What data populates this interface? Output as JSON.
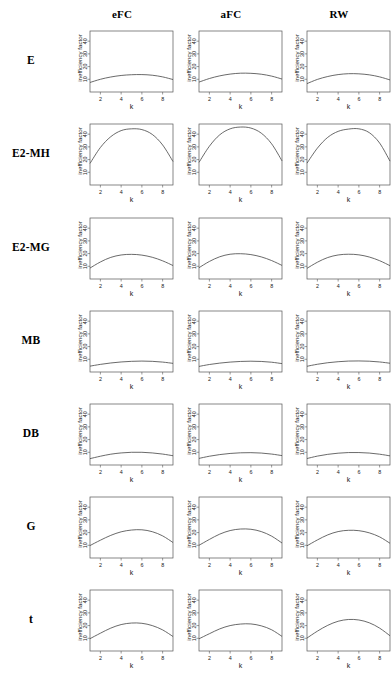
{
  "figure": {
    "row_labels": [
      "E",
      "E2-MH",
      "E2-MG",
      "MB",
      "DB",
      "G",
      "t"
    ],
    "col_labels": [
      "eFC",
      "aFC",
      "RW"
    ],
    "axis": {
      "ylabel": "inefficiency factor",
      "xlabel": "k",
      "ytick_labels": [
        "10",
        "20",
        "30",
        "40"
      ],
      "xtick_labels": [
        "2",
        "4",
        "6",
        "8"
      ]
    }
  },
  "chart_data": [
    {
      "type": "line",
      "title": "E / eFC",
      "row": "E",
      "column": "eFC",
      "xlabel": "k",
      "ylabel": "inefficiency factor",
      "xlim": [
        1,
        9
      ],
      "ylim": [
        0,
        48
      ],
      "xticks": [
        2,
        4,
        6,
        8
      ],
      "yticks": [
        10,
        20,
        30,
        40
      ],
      "grid": false,
      "legend": false,
      "x": [
        1,
        2,
        3,
        4,
        5,
        6,
        7,
        8,
        9
      ],
      "y": [
        7.5,
        10.0,
        11.8,
        13.0,
        13.6,
        13.7,
        13.2,
        11.9,
        9.8
      ]
    },
    {
      "type": "line",
      "title": "E / aFC",
      "row": "E",
      "column": "aFC",
      "xlabel": "k",
      "ylabel": "inefficiency factor",
      "xlim": [
        1,
        9
      ],
      "ylim": [
        0,
        48
      ],
      "xticks": [
        2,
        4,
        6,
        8
      ],
      "yticks": [
        10,
        20,
        30,
        40
      ],
      "grid": false,
      "legend": false,
      "x": [
        1,
        2,
        3,
        4,
        5,
        6,
        7,
        8,
        9
      ],
      "y": [
        7.8,
        10.6,
        12.7,
        14.1,
        14.8,
        14.7,
        14.0,
        12.5,
        10.2
      ]
    },
    {
      "type": "line",
      "title": "E / RW",
      "row": "E",
      "column": "RW",
      "xlabel": "k",
      "ylabel": "inefficiency factor",
      "xlim": [
        1,
        9
      ],
      "ylim": [
        0,
        48
      ],
      "xticks": [
        2,
        4,
        6,
        8
      ],
      "yticks": [
        10,
        20,
        30,
        40
      ],
      "grid": false,
      "legend": false,
      "x": [
        1,
        2,
        3,
        4,
        5,
        6,
        7,
        8,
        9
      ],
      "y": [
        6.6,
        9.9,
        12.2,
        13.7,
        14.4,
        14.3,
        13.5,
        11.9,
        9.5
      ]
    },
    {
      "type": "line",
      "title": "E2-MH / eFC",
      "row": "E2-MH",
      "column": "eFC",
      "xlabel": "k",
      "ylabel": "inefficiency factor",
      "xlim": [
        1,
        9
      ],
      "ylim": [
        0,
        48
      ],
      "xticks": [
        2,
        4,
        6,
        8
      ],
      "yticks": [
        10,
        20,
        30,
        40
      ],
      "grid": false,
      "legend": false,
      "x": [
        1,
        2,
        3,
        4,
        5,
        6,
        7,
        8,
        9
      ],
      "y": [
        17.0,
        29.5,
        38.0,
        42.8,
        44.2,
        43.6,
        39.8,
        31.5,
        18.5
      ]
    },
    {
      "type": "line",
      "title": "E2-MH / aFC",
      "row": "E2-MH",
      "column": "aFC",
      "xlabel": "k",
      "ylabel": "inefficiency factor",
      "xlim": [
        1,
        9
      ],
      "ylim": [
        0,
        48
      ],
      "xticks": [
        2,
        4,
        6,
        8
      ],
      "yticks": [
        10,
        20,
        30,
        40
      ],
      "grid": false,
      "legend": false,
      "x": [
        1,
        2,
        3,
        4,
        5,
        6,
        7,
        8,
        9
      ],
      "y": [
        17.8,
        30.5,
        39.5,
        44.2,
        45.6,
        44.8,
        40.8,
        32.4,
        19.0
      ]
    },
    {
      "type": "line",
      "title": "E2-MH / RW",
      "row": "E2-MH",
      "column": "RW",
      "xlabel": "k",
      "ylabel": "inefficiency factor",
      "xlim": [
        1,
        9
      ],
      "ylim": [
        0,
        48
      ],
      "xticks": [
        2,
        4,
        6,
        8
      ],
      "yticks": [
        10,
        20,
        30,
        40
      ],
      "grid": false,
      "legend": false,
      "x": [
        1,
        2,
        3,
        4,
        5,
        6,
        7,
        8,
        9
      ],
      "y": [
        17.2,
        29.0,
        37.5,
        42.2,
        44.0,
        44.2,
        41.2,
        33.0,
        18.8
      ]
    },
    {
      "type": "line",
      "title": "E2-MG / eFC",
      "row": "E2-MG",
      "column": "eFC",
      "xlabel": "k",
      "ylabel": "inefficiency factor",
      "xlim": [
        1,
        9
      ],
      "ylim": [
        0,
        48
      ],
      "xticks": [
        2,
        4,
        6,
        8
      ],
      "yticks": [
        10,
        20,
        30,
        40
      ],
      "grid": false,
      "legend": false,
      "x": [
        1,
        2,
        3,
        4,
        5,
        6,
        7,
        8,
        9
      ],
      "y": [
        8.6,
        13.4,
        17.0,
        18.9,
        19.4,
        18.8,
        17.1,
        14.3,
        10.6
      ]
    },
    {
      "type": "line",
      "title": "E2-MG / aFC",
      "row": "E2-MG",
      "column": "aFC",
      "xlabel": "k",
      "ylabel": "inefficiency factor",
      "xlim": [
        1,
        9
      ],
      "ylim": [
        0,
        48
      ],
      "xticks": [
        2,
        4,
        6,
        8
      ],
      "yticks": [
        10,
        20,
        30,
        40
      ],
      "grid": false,
      "legend": false,
      "x": [
        1,
        2,
        3,
        4,
        5,
        6,
        7,
        8,
        9
      ],
      "y": [
        8.9,
        13.8,
        17.5,
        19.5,
        19.9,
        19.2,
        17.4,
        14.5,
        10.7
      ]
    },
    {
      "type": "line",
      "title": "E2-MG / RW",
      "row": "E2-MG",
      "column": "RW",
      "xlabel": "k",
      "ylabel": "inefficiency factor",
      "xlim": [
        1,
        9
      ],
      "ylim": [
        0,
        48
      ],
      "xticks": [
        2,
        4,
        6,
        8
      ],
      "yticks": [
        10,
        20,
        30,
        40
      ],
      "grid": false,
      "legend": false,
      "x": [
        1,
        2,
        3,
        4,
        5,
        6,
        7,
        8,
        9
      ],
      "y": [
        8.4,
        13.2,
        16.9,
        18.9,
        19.5,
        19.0,
        17.3,
        14.4,
        10.5
      ]
    },
    {
      "type": "line",
      "title": "MB / eFC",
      "row": "MB",
      "column": "eFC",
      "xlabel": "k",
      "ylabel": "inefficiency factor",
      "xlim": [
        1,
        9
      ],
      "ylim": [
        0,
        48
      ],
      "xticks": [
        2,
        4,
        6,
        8
      ],
      "yticks": [
        10,
        20,
        30,
        40
      ],
      "grid": false,
      "legend": false,
      "x": [
        1,
        2,
        3,
        4,
        5,
        6,
        7,
        8,
        9
      ],
      "y": [
        4.6,
        6.0,
        7.1,
        7.9,
        8.4,
        8.6,
        8.4,
        7.8,
        6.8
      ]
    },
    {
      "type": "line",
      "title": "MB / aFC",
      "row": "MB",
      "column": "aFC",
      "xlabel": "k",
      "ylabel": "inefficiency factor",
      "xlim": [
        1,
        9
      ],
      "ylim": [
        0,
        48
      ],
      "xticks": [
        2,
        4,
        6,
        8
      ],
      "yticks": [
        10,
        20,
        30,
        40
      ],
      "grid": false,
      "legend": false,
      "x": [
        1,
        2,
        3,
        4,
        5,
        6,
        7,
        8,
        9
      ],
      "y": [
        4.4,
        5.9,
        7.0,
        7.8,
        8.3,
        8.5,
        8.3,
        7.7,
        6.6
      ]
    },
    {
      "type": "line",
      "title": "MB / RW",
      "row": "MB",
      "column": "RW",
      "xlabel": "k",
      "ylabel": "inefficiency factor",
      "xlim": [
        1,
        9
      ],
      "ylim": [
        0,
        48
      ],
      "xticks": [
        2,
        4,
        6,
        8
      ],
      "yticks": [
        10,
        20,
        30,
        40
      ],
      "grid": false,
      "legend": false,
      "x": [
        1,
        2,
        3,
        4,
        5,
        6,
        7,
        8,
        9
      ],
      "y": [
        4.5,
        6.1,
        7.3,
        8.1,
        8.6,
        8.7,
        8.5,
        7.9,
        6.9
      ]
    },
    {
      "type": "line",
      "title": "DB / eFC",
      "row": "DB",
      "column": "eFC",
      "xlabel": "k",
      "ylabel": "inefficiency factor",
      "xlim": [
        1,
        9
      ],
      "ylim": [
        0,
        48
      ],
      "xticks": [
        2,
        4,
        6,
        8
      ],
      "yticks": [
        10,
        20,
        30,
        40
      ],
      "grid": false,
      "legend": false,
      "x": [
        1,
        2,
        3,
        4,
        5,
        6,
        7,
        8,
        9
      ],
      "y": [
        5.0,
        6.9,
        8.5,
        9.5,
        10.0,
        10.0,
        9.5,
        8.6,
        7.3
      ]
    },
    {
      "type": "line",
      "title": "DB / aFC",
      "row": "DB",
      "column": "aFC",
      "xlabel": "k",
      "ylabel": "inefficiency factor",
      "xlim": [
        1,
        9
      ],
      "ylim": [
        0,
        48
      ],
      "xticks": [
        2,
        4,
        6,
        8
      ],
      "yticks": [
        10,
        20,
        30,
        40
      ],
      "grid": false,
      "legend": false,
      "x": [
        1,
        2,
        3,
        4,
        5,
        6,
        7,
        8,
        9
      ],
      "y": [
        5.2,
        6.9,
        8.2,
        9.1,
        9.6,
        9.7,
        9.4,
        8.6,
        7.4
      ]
    },
    {
      "type": "line",
      "title": "DB / RW",
      "row": "DB",
      "column": "RW",
      "xlabel": "k",
      "ylabel": "inefficiency factor",
      "xlim": [
        1,
        9
      ],
      "ylim": [
        0,
        48
      ],
      "xticks": [
        2,
        4,
        6,
        8
      ],
      "yticks": [
        10,
        20,
        30,
        40
      ],
      "grid": false,
      "legend": false,
      "x": [
        1,
        2,
        3,
        4,
        5,
        6,
        7,
        8,
        9
      ],
      "y": [
        5.1,
        7.0,
        8.4,
        9.3,
        9.8,
        9.8,
        9.4,
        8.5,
        7.2
      ]
    },
    {
      "type": "line",
      "title": "G / eFC",
      "row": "G",
      "column": "eFC",
      "xlabel": "k",
      "ylabel": "inefficiency factor",
      "xlim": [
        1,
        9
      ],
      "ylim": [
        0,
        48
      ],
      "xticks": [
        2,
        4,
        6,
        8
      ],
      "yticks": [
        10,
        20,
        30,
        40
      ],
      "grid": false,
      "legend": false,
      "x": [
        1,
        2,
        3,
        4,
        5,
        6,
        7,
        8,
        9
      ],
      "y": [
        9.8,
        14.0,
        17.8,
        20.6,
        22.0,
        22.2,
        20.7,
        17.4,
        12.2
      ]
    },
    {
      "type": "line",
      "title": "G / aFC",
      "row": "G",
      "column": "aFC",
      "xlabel": "k",
      "ylabel": "inefficiency factor",
      "xlim": [
        1,
        9
      ],
      "ylim": [
        0,
        48
      ],
      "xticks": [
        2,
        4,
        6,
        8
      ],
      "yticks": [
        10,
        20,
        30,
        40
      ],
      "grid": false,
      "legend": false,
      "x": [
        1,
        2,
        3,
        4,
        5,
        6,
        7,
        8,
        9
      ],
      "y": [
        10.0,
        14.6,
        18.8,
        21.6,
        22.8,
        22.6,
        20.8,
        17.2,
        11.8
      ]
    },
    {
      "type": "line",
      "title": "G / RW",
      "row": "G",
      "column": "RW",
      "xlabel": "k",
      "ylabel": "inefficiency factor",
      "xlim": [
        1,
        9
      ],
      "ylim": [
        0,
        48
      ],
      "xticks": [
        2,
        4,
        6,
        8
      ],
      "yticks": [
        10,
        20,
        30,
        40
      ],
      "grid": false,
      "legend": false,
      "x": [
        1,
        2,
        3,
        4,
        5,
        6,
        7,
        8,
        9
      ],
      "y": [
        9.6,
        14.2,
        18.2,
        20.8,
        21.8,
        21.5,
        19.8,
        16.6,
        11.6
      ]
    },
    {
      "type": "line",
      "title": "t / eFC",
      "row": "t",
      "column": "eFC",
      "xlabel": "k",
      "ylabel": "inefficiency factor",
      "xlim": [
        1,
        9
      ],
      "ylim": [
        0,
        48
      ],
      "xticks": [
        2,
        4,
        6,
        8
      ],
      "yticks": [
        10,
        20,
        30,
        40
      ],
      "grid": false,
      "legend": false,
      "x": [
        1,
        2,
        3,
        4,
        5,
        6,
        7,
        8,
        9
      ],
      "y": [
        9.7,
        14.0,
        18.0,
        20.8,
        22.0,
        21.8,
        20.0,
        16.6,
        11.4
      ]
    },
    {
      "type": "line",
      "title": "t / aFC",
      "row": "t",
      "column": "aFC",
      "xlabel": "k",
      "ylabel": "inefficiency factor",
      "xlim": [
        1,
        9
      ],
      "ylim": [
        0,
        48
      ],
      "xticks": [
        2,
        4,
        6,
        8
      ],
      "yticks": [
        10,
        20,
        30,
        40
      ],
      "grid": false,
      "legend": false,
      "x": [
        1,
        2,
        3,
        4,
        5,
        6,
        7,
        8,
        9
      ],
      "y": [
        9.6,
        13.6,
        17.4,
        20.0,
        21.2,
        21.3,
        19.8,
        16.7,
        11.5
      ]
    },
    {
      "type": "line",
      "title": "t / RW",
      "row": "t",
      "column": "RW",
      "xlabel": "k",
      "ylabel": "inefficiency factor",
      "xlim": [
        1,
        9
      ],
      "ylim": [
        0,
        48
      ],
      "xticks": [
        2,
        4,
        6,
        8
      ],
      "yticks": [
        10,
        20,
        30,
        40
      ],
      "grid": false,
      "legend": false,
      "x": [
        1,
        2,
        3,
        4,
        5,
        6,
        7,
        8,
        9
      ],
      "y": [
        10.2,
        15.6,
        20.2,
        23.4,
        24.8,
        24.4,
        22.2,
        18.0,
        12.0
      ]
    }
  ]
}
